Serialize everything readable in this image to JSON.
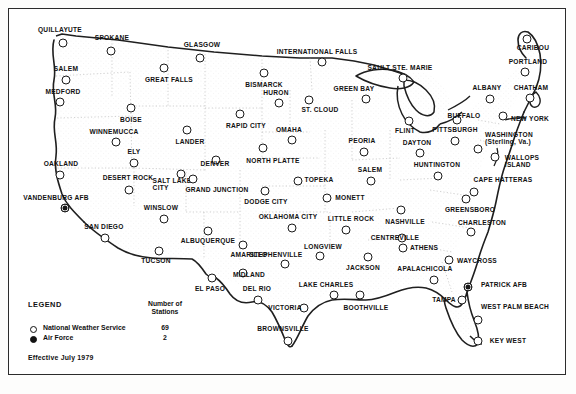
{
  "legend": {
    "heading": "LEGEND",
    "count_header": "Number of\nStations",
    "count_header_line1": "Number of",
    "count_header_line2": "Stations",
    "rows": [
      {
        "symbol": "open-circle",
        "label": "National Weather Service",
        "count": "69"
      },
      {
        "symbol": "filled-circle",
        "label": "Air Force",
        "count": "2"
      }
    ],
    "effective": "Effective July 1979"
  },
  "map": {
    "stations": [
      {
        "name": "QUILLAYUTE",
        "type": "nws",
        "cx": 63,
        "cy": 43,
        "lx": 60,
        "ly": 30,
        "anchor": "center"
      },
      {
        "name": "SPOKANE",
        "type": "nws",
        "cx": 111,
        "cy": 51,
        "lx": 112,
        "ly": 38,
        "anchor": "center"
      },
      {
        "name": "SALEM",
        "type": "nws",
        "cx": 66,
        "cy": 80,
        "lx": 66,
        "ly": 69,
        "anchor": "center"
      },
      {
        "name": "MEDFORD",
        "type": "nws",
        "cx": 60,
        "cy": 102,
        "lx": 63,
        "ly": 92,
        "anchor": "center"
      },
      {
        "name": "GREAT FALLS",
        "type": "nws",
        "cx": 164,
        "cy": 68,
        "lx": 169,
        "ly": 80,
        "anchor": "center"
      },
      {
        "name": "GLASGOW",
        "type": "nws",
        "cx": 200,
        "cy": 58,
        "lx": 202,
        "ly": 45,
        "anchor": "center"
      },
      {
        "name": "BOISE",
        "type": "nws",
        "cx": 131,
        "cy": 108,
        "lx": 131,
        "ly": 120,
        "anchor": "center"
      },
      {
        "name": "WINNEMUCCA",
        "type": "nws",
        "cx": 116,
        "cy": 142,
        "lx": 114,
        "ly": 132,
        "anchor": "center"
      },
      {
        "name": "ELY",
        "type": "nws",
        "cx": 134,
        "cy": 163,
        "lx": 134,
        "ly": 152,
        "anchor": "center"
      },
      {
        "name": "OAKLAND",
        "type": "nws",
        "cx": 60,
        "cy": 175,
        "lx": 61,
        "ly": 164,
        "anchor": "center"
      },
      {
        "name": "DESERT ROCK",
        "type": "nws",
        "cx": 129,
        "cy": 190,
        "lx": 128,
        "ly": 178,
        "anchor": "center"
      },
      {
        "name": "SALT LAKE\nCITY",
        "type": "nws",
        "cx": 181,
        "cy": 174,
        "lx": 172,
        "ly": 184,
        "anchor": "center",
        "lines": [
          "SALT LAKE",
          "CITY"
        ]
      },
      {
        "name": "VANDENBURG AFB",
        "type": "af",
        "cx": 65,
        "cy": 208,
        "lx": 56,
        "ly": 198,
        "anchor": "center"
      },
      {
        "name": "SAN DIEGO",
        "type": "nws",
        "cx": 105,
        "cy": 238,
        "lx": 104,
        "ly": 227,
        "anchor": "center"
      },
      {
        "name": "WINSLOW",
        "type": "nws",
        "cx": 164,
        "cy": 219,
        "lx": 161,
        "ly": 208,
        "anchor": "center"
      },
      {
        "name": "TUCSON",
        "type": "nws",
        "cx": 159,
        "cy": 251,
        "lx": 156,
        "ly": 261,
        "anchor": "center"
      },
      {
        "name": "ALBUQUERQUE",
        "type": "nws",
        "cx": 208,
        "cy": 231,
        "lx": 208,
        "ly": 241,
        "anchor": "center"
      },
      {
        "name": "EL PASO",
        "type": "nws",
        "cx": 212,
        "cy": 278,
        "lx": 210,
        "ly": 289,
        "anchor": "center"
      },
      {
        "name": "LANDER",
        "type": "nws",
        "cx": 187,
        "cy": 130,
        "lx": 190,
        "ly": 142,
        "anchor": "center"
      },
      {
        "name": "DENVER",
        "type": "nws",
        "cx": 216,
        "cy": 160,
        "lx": 215,
        "ly": 164,
        "anchor": "center"
      },
      {
        "name": "GRAND JUNCTION",
        "type": "nws",
        "cx": 193,
        "cy": 179,
        "lx": 217,
        "ly": 190,
        "anchor": "center"
      },
      {
        "name": "RAPID CITY",
        "type": "nws",
        "cx": 240,
        "cy": 114,
        "lx": 246,
        "ly": 126,
        "anchor": "center"
      },
      {
        "name": "BISMARCK",
        "type": "nws",
        "cx": 264,
        "cy": 73,
        "lx": 264,
        "ly": 85,
        "anchor": "center"
      },
      {
        "name": "HURON",
        "type": "nws",
        "cx": 279,
        "cy": 103,
        "lx": 276,
        "ly": 93,
        "anchor": "center"
      },
      {
        "name": "OMAHA",
        "type": "nws",
        "cx": 292,
        "cy": 140,
        "lx": 289,
        "ly": 130,
        "anchor": "center"
      },
      {
        "name": "NORTH PLATTE",
        "type": "nws",
        "cx": 263,
        "cy": 148,
        "lx": 273,
        "ly": 161,
        "anchor": "center"
      },
      {
        "name": "DODGE CITY",
        "type": "nws",
        "cx": 265,
        "cy": 191,
        "lx": 266,
        "ly": 202,
        "anchor": "center"
      },
      {
        "name": "TOPEKA",
        "type": "nws",
        "cx": 298,
        "cy": 181,
        "lx": 319,
        "ly": 180,
        "anchor": "center"
      },
      {
        "name": "OKLAHOMA CITY",
        "type": "nws",
        "cx": 292,
        "cy": 228,
        "lx": 288,
        "ly": 217,
        "anchor": "center"
      },
      {
        "name": "AMARILLO",
        "type": "nws",
        "cx": 243,
        "cy": 245,
        "lx": 249,
        "ly": 255,
        "anchor": "center"
      },
      {
        "name": "MIDLAND",
        "type": "nws",
        "cx": 243,
        "cy": 273,
        "lx": 249,
        "ly": 275,
        "anchor": "center"
      },
      {
        "name": "STEPHENVILLE",
        "type": "nws",
        "cx": 285,
        "cy": 264,
        "lx": 276,
        "ly": 255,
        "anchor": "center"
      },
      {
        "name": "DEL RIO",
        "type": "nws",
        "cx": 258,
        "cy": 300,
        "lx": 257,
        "ly": 289,
        "anchor": "center"
      },
      {
        "name": "VICTORIA",
        "type": "nws",
        "cx": 304,
        "cy": 308,
        "lx": 285,
        "ly": 308,
        "anchor": "center"
      },
      {
        "name": "BROWNSVILLE",
        "type": "nws",
        "cx": 288,
        "cy": 341,
        "lx": 283,
        "ly": 329,
        "anchor": "center"
      },
      {
        "name": "LAKE CHARLES",
        "type": "nws",
        "cx": 334,
        "cy": 295,
        "lx": 326,
        "ly": 285,
        "anchor": "center"
      },
      {
        "name": "BOOTHVILLE",
        "type": "nws",
        "cx": 360,
        "cy": 295,
        "lx": 366,
        "ly": 308,
        "anchor": "center"
      },
      {
        "name": "LONGVIEW",
        "type": "nws",
        "cx": 320,
        "cy": 256,
        "lx": 323,
        "ly": 247,
        "anchor": "center"
      },
      {
        "name": "JACKSON",
        "type": "nws",
        "cx": 368,
        "cy": 257,
        "lx": 363,
        "ly": 268,
        "anchor": "center"
      },
      {
        "name": "LITTLE ROCK",
        "type": "nws",
        "cx": 346,
        "cy": 230,
        "lx": 351,
        "ly": 219,
        "anchor": "center"
      },
      {
        "name": "MONETT",
        "type": "nws",
        "cx": 327,
        "cy": 198,
        "lx": 350,
        "ly": 198,
        "anchor": "center"
      },
      {
        "name": "CENTREVILLE",
        "type": "nws",
        "cx": 402,
        "cy": 238,
        "lx": 395,
        "ly": 238,
        "anchor": "right"
      },
      {
        "name": "NASHVILLE",
        "type": "nws",
        "cx": 401,
        "cy": 210,
        "lx": 405,
        "ly": 222,
        "anchor": "center"
      },
      {
        "name": "ATHENS",
        "type": "nws",
        "cx": 403,
        "cy": 248,
        "lx": 424,
        "ly": 248,
        "anchor": "center"
      },
      {
        "name": "APALACHICOLA",
        "type": "nws",
        "cx": 434,
        "cy": 280,
        "lx": 425,
        "ly": 269,
        "anchor": "center"
      },
      {
        "name": "TAMPA",
        "type": "nws",
        "cx": 462,
        "cy": 300,
        "lx": 444,
        "ly": 300,
        "anchor": "center"
      },
      {
        "name": "WEST PALM BEACH",
        "type": "nws",
        "cx": 478,
        "cy": 320,
        "lx": 515,
        "ly": 307,
        "anchor": "center"
      },
      {
        "name": "KEY WEST",
        "type": "nws",
        "cx": 478,
        "cy": 341,
        "lx": 508,
        "ly": 341,
        "anchor": "center"
      },
      {
        "name": "PATRICK AFB",
        "type": "af",
        "cx": 468,
        "cy": 287,
        "lx": 504,
        "ly": 285,
        "anchor": "center"
      },
      {
        "name": "WAYCROSS",
        "type": "nws",
        "cx": 449,
        "cy": 260,
        "lx": 477,
        "ly": 261,
        "anchor": "center"
      },
      {
        "name": "CHARLESTON",
        "type": "nws",
        "cx": 471,
        "cy": 232,
        "lx": 482,
        "ly": 223,
        "anchor": "center"
      },
      {
        "name": "GREENSBORO",
        "type": "nws",
        "cx": 466,
        "cy": 199,
        "lx": 470,
        "ly": 210,
        "anchor": "center"
      },
      {
        "name": "CAPE HATTERAS",
        "type": "nws",
        "cx": 474,
        "cy": 192,
        "lx": 503,
        "ly": 180,
        "anchor": "center"
      },
      {
        "name": "WALLOPS\nISLAND",
        "type": "nws",
        "cx": 495,
        "cy": 157,
        "lx": 522,
        "ly": 161,
        "anchor": "center",
        "lines": [
          "WALLOPS",
          "ISLAND"
        ]
      },
      {
        "name": "WASHINGTON\n(Sterling, Va.)",
        "type": "nws",
        "cx": 478,
        "cy": 149,
        "lx": 509,
        "ly": 138,
        "anchor": "center",
        "lines": [
          "WASHINGTON",
          "(Sterling, Va.)"
        ]
      },
      {
        "name": "NEW YORK",
        "type": "nws",
        "cx": 503,
        "cy": 116,
        "lx": 530,
        "ly": 119,
        "anchor": "center"
      },
      {
        "name": "CHATHAM",
        "type": "nws",
        "cx": 530,
        "cy": 98,
        "lx": 531,
        "ly": 88,
        "anchor": "center"
      },
      {
        "name": "ALBANY",
        "type": "nws",
        "cx": 490,
        "cy": 99,
        "lx": 487,
        "ly": 88,
        "anchor": "center"
      },
      {
        "name": "PORTLAND",
        "type": "nws",
        "cx": 525,
        "cy": 72,
        "lx": 528,
        "ly": 62,
        "anchor": "center"
      },
      {
        "name": "CARIBOU",
        "type": "nws",
        "cx": 527,
        "cy": 39,
        "lx": 533,
        "ly": 48,
        "anchor": "center"
      },
      {
        "name": "BUFFALO",
        "type": "nws",
        "cx": 457,
        "cy": 120,
        "lx": 464,
        "ly": 116,
        "anchor": "center"
      },
      {
        "name": "PITTSBURGH",
        "type": "nws",
        "cx": 455,
        "cy": 141,
        "lx": 455,
        "ly": 130,
        "anchor": "center"
      },
      {
        "name": "FLINT",
        "type": "nws",
        "cx": 409,
        "cy": 121,
        "lx": 405,
        "ly": 131,
        "anchor": "center"
      },
      {
        "name": "DAYTON",
        "type": "nws",
        "cx": 420,
        "cy": 153,
        "lx": 417,
        "ly": 143,
        "anchor": "center"
      },
      {
        "name": "HUNTINGTON",
        "type": "nws",
        "cx": 438,
        "cy": 176,
        "lx": 437,
        "ly": 165,
        "anchor": "center"
      },
      {
        "name": "SALEM",
        "type": "nws",
        "cx": 371,
        "cy": 181,
        "lx": 370,
        "ly": 170,
        "anchor": "center"
      },
      {
        "name": "PEORIA",
        "type": "nws",
        "cx": 364,
        "cy": 152,
        "lx": 362,
        "ly": 141,
        "anchor": "center"
      },
      {
        "name": "GREEN BAY",
        "type": "nws",
        "cx": 366,
        "cy": 99,
        "lx": 354,
        "ly": 89,
        "anchor": "center"
      },
      {
        "name": "ST. CLOUD",
        "type": "nws",
        "cx": 309,
        "cy": 100,
        "lx": 320,
        "ly": 110,
        "anchor": "center"
      },
      {
        "name": "SAULT STE. MARIE",
        "type": "nws",
        "cx": 403,
        "cy": 78,
        "lx": 400,
        "ly": 68,
        "anchor": "center"
      },
      {
        "name": "INTERNATIONAL FALLS",
        "type": "nws",
        "cx": 322,
        "cy": 62,
        "lx": 317,
        "ly": 52,
        "anchor": "center"
      }
    ]
  }
}
